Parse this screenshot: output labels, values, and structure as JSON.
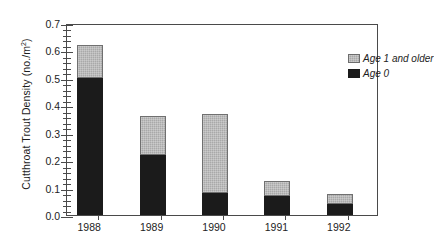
{
  "chart_data": {
    "type": "bar",
    "stacked": true,
    "title": "",
    "xlabel": "",
    "ylabel": "Cutthroat Trout Density (no./m2)",
    "ylabel_parts": {
      "main": "Cutthroat Trout Density (no./m",
      "sup": "2",
      "tail": ")"
    },
    "categories": [
      "1988",
      "1989",
      "1990",
      "1991",
      "1992"
    ],
    "series": [
      {
        "name": "Age 0",
        "color": "#1b1b1b",
        "values": [
          0.5,
          0.22,
          0.08,
          0.07,
          0.04
        ]
      },
      {
        "name": "Age 1 and older",
        "color": "#a9a9a9",
        "values": [
          0.12,
          0.14,
          0.29,
          0.055,
          0.035
        ]
      }
    ],
    "totals": [
      0.62,
      0.36,
      0.37,
      0.125,
      0.075
    ],
    "ylim": [
      0.0,
      0.7
    ],
    "ytick_step": 0.1,
    "yminor_step": 0.02,
    "ytick_labels": [
      "0.0",
      "0.1",
      "0.2",
      "0.3",
      "0.4",
      "0.5",
      "0.6",
      "0.7"
    ],
    "grid": false,
    "legend_position": "top-right",
    "legend_entries": [
      "Age 1 and older",
      "Age 0"
    ]
  },
  "legend": {
    "age1_label": "Age 1 and older",
    "age0_label": "Age 0"
  },
  "axis": {
    "y_title_main": "Cutthroat Trout Density (no./m",
    "y_title_sup": "2",
    "y_title_tail": ")"
  }
}
